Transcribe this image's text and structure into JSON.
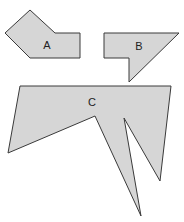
{
  "diagram": {
    "shapes": [
      {
        "id": "A",
        "label": "A",
        "points": "30,10 55,33 80,33 80,58 30,58 5,33",
        "label_pos": [
          47,
          46
        ]
      },
      {
        "id": "B",
        "label": "B",
        "points": "104,33 179,33 129,82 129,58 104,58",
        "label_pos": [
          139,
          47
        ]
      },
      {
        "id": "C",
        "label": "C",
        "points": "20,86 171,86 160,181 124,118 141,216 95,116 8,153",
        "label_pos": [
          92,
          103
        ]
      }
    ],
    "fill_color": "#d6d6d6",
    "stroke_color": "#3a3a3a"
  }
}
